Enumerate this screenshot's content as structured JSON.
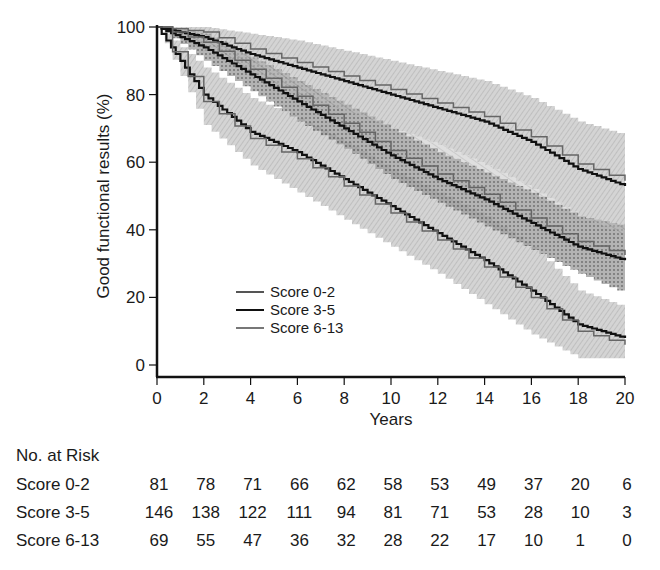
{
  "chart_data": {
    "type": "line",
    "subtype": "kaplan-meier survival curves with confidence bands",
    "title": "",
    "xlabel": "Years",
    "ylabel": "Good functional results (%)",
    "xlim": [
      0,
      20
    ],
    "ylim": [
      0,
      100
    ],
    "xticks": [
      0,
      2,
      4,
      6,
      8,
      10,
      12,
      14,
      16,
      18,
      20
    ],
    "yticks": [
      0,
      20,
      40,
      60,
      80,
      100
    ],
    "grid": false,
    "legend_position": "lower-left inside plot",
    "legend": [
      "Score 0-2",
      "Score 3-5",
      "Score 6-13"
    ],
    "x": [
      0,
      2,
      4,
      6,
      8,
      10,
      12,
      14,
      16,
      18,
      20
    ],
    "series": [
      {
        "name": "Score 0-2",
        "color": "#202020",
        "values": [
          100,
          97,
          92,
          88,
          84,
          80,
          76,
          72,
          66,
          58,
          53
        ],
        "ci_upper": [
          100,
          100,
          98,
          96,
          93,
          90,
          87,
          84,
          79,
          72,
          68
        ],
        "ci_lower": [
          100,
          93,
          86,
          80,
          75,
          70,
          65,
          59,
          52,
          44,
          38
        ]
      },
      {
        "name": "Score 3-5",
        "color": "#101010",
        "values": [
          100,
          94,
          86,
          78,
          70,
          62,
          55,
          49,
          42,
          35,
          31
        ],
        "ci_upper": [
          100,
          98,
          91,
          84,
          77,
          70,
          63,
          57,
          51,
          44,
          41
        ],
        "ci_lower": [
          100,
          90,
          81,
          72,
          64,
          55,
          48,
          41,
          34,
          27,
          21
        ]
      },
      {
        "name": "Score 6-13",
        "color": "#6a6a6a",
        "values": [
          100,
          80,
          69,
          63,
          55,
          47,
          39,
          31,
          22,
          12,
          8
        ],
        "ci_upper": [
          100,
          88,
          79,
          73,
          66,
          58,
          51,
          44,
          35,
          22,
          17
        ],
        "ci_lower": [
          100,
          71,
          59,
          51,
          43,
          35,
          27,
          18,
          9,
          2,
          2
        ]
      }
    ]
  },
  "axes": {
    "xlabel": "Years",
    "ylabel": "Good functional results (%)",
    "xtick_labels": [
      "0",
      "2",
      "4",
      "6",
      "8",
      "10",
      "12",
      "14",
      "16",
      "18",
      "20"
    ],
    "ytick_labels": [
      "0",
      "20",
      "40",
      "60",
      "80",
      "100"
    ]
  },
  "legend": {
    "items": [
      {
        "label": "Score 0-2",
        "color": "#555555"
      },
      {
        "label": "Score 3-5",
        "color": "#111111"
      },
      {
        "label": "Score 6-13",
        "color": "#777777"
      }
    ]
  },
  "risk_table": {
    "title": "No. at Risk",
    "rows": [
      {
        "label": "Score 0-2",
        "values": [
          "81",
          "78",
          "71",
          "66",
          "62",
          "58",
          "53",
          "49",
          "37",
          "20",
          "6"
        ]
      },
      {
        "label": "Score 3-5",
        "values": [
          "146",
          "138",
          "122",
          "111",
          "94",
          "81",
          "71",
          "53",
          "28",
          "10",
          "3"
        ]
      },
      {
        "label": "Score 6-13",
        "values": [
          "69",
          "55",
          "47",
          "36",
          "32",
          "28",
          "22",
          "17",
          "10",
          "1",
          "0"
        ]
      }
    ]
  }
}
